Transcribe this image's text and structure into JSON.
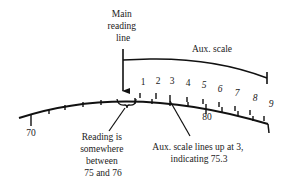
{
  "diagram": {
    "colors": {
      "ink": "#111111",
      "background": "#ffffff"
    },
    "main_reading_line": {
      "label_lines": [
        "Main",
        "reading",
        "line"
      ]
    },
    "aux_scale": {
      "label": "Aux. scale",
      "tick_labels": [
        "1",
        "2",
        "3",
        "4",
        "5",
        "6",
        "7",
        "8",
        "9"
      ]
    },
    "main_scale": {
      "major_labels": [
        "70",
        "80"
      ]
    },
    "annotations": {
      "reading_range": {
        "lines": [
          "Reading is",
          "somewhere",
          "between",
          "75 and 76"
        ]
      },
      "aux_alignment": {
        "lines": [
          "Aux. scale lines up at 3,",
          "indicating 75.3"
        ]
      }
    }
  }
}
